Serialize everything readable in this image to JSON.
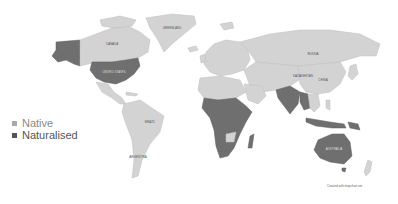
{
  "legend": {
    "items": [
      {
        "label": "Native",
        "color": "#a9a9a9"
      },
      {
        "label": "Naturalised",
        "color": "#555555"
      }
    ]
  },
  "colors": {
    "native": "#d3d3d3",
    "naturalised": "#6f6f6f",
    "background": "#ffffff"
  },
  "map_labels": {
    "canada": "CANADA",
    "usa": "UNITED STATES",
    "greenland": "GREENLAND",
    "russia": "RUSSIA",
    "china": "CHINA",
    "kazakhstan": "KAZAKHSTAN",
    "brazil": "BRAZIL",
    "argentina": "ARGENTINA",
    "australia": "AUSTRALIA"
  },
  "credit": "Created with mapchart.net"
}
